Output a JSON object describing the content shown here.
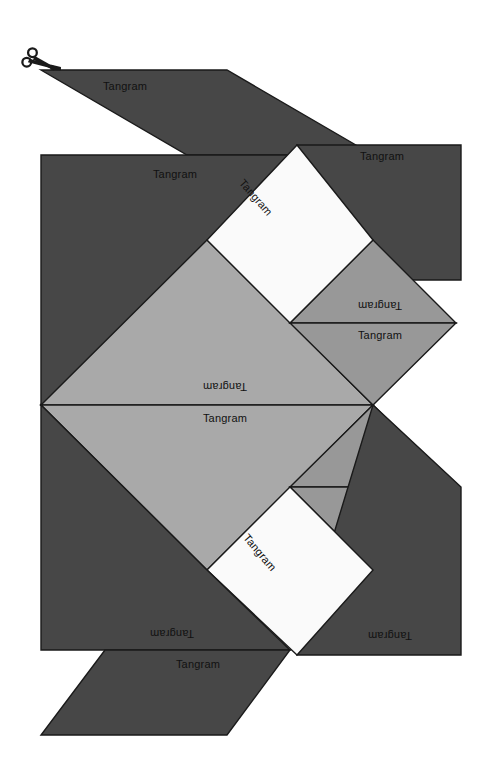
{
  "page": {
    "title": "Tangram",
    "background_color": "#ffffff",
    "width": 490,
    "height": 775
  },
  "colors": {
    "dark_gray": "#474747",
    "medium_gray": "#989898",
    "light_gray": "#a9a9a9",
    "white": "#fafafa",
    "outline": "#1a1a1a",
    "label_text": "#111111"
  },
  "cut_guide": {
    "icon": "scissors-icon",
    "label": ""
  },
  "labels": {
    "piece_label": "Tangram"
  },
  "pieces": [
    {
      "id": "top-parallelogram",
      "name": "Tangram",
      "shape": "parallelogram",
      "color": "#474747",
      "label_rotation": 0,
      "label_flipped": false
    },
    {
      "id": "upper-left-rect-dark",
      "name": "Tangram",
      "shape": "rectangle",
      "color": "#474747",
      "label_rotation": 0,
      "label_flipped": false
    },
    {
      "id": "upper-white-square",
      "name": "Tangram",
      "shape": "square",
      "color": "#fafafa",
      "label_rotation": -45,
      "label_flipped": false
    },
    {
      "id": "upper-right-rect-dark",
      "name": "Tangram",
      "shape": "rectangle",
      "color": "#474747",
      "label_rotation": 0,
      "label_flipped": false
    },
    {
      "id": "upper-right-tri-med-up",
      "name": "Tangram",
      "shape": "triangle",
      "color": "#989898",
      "label_rotation": 180,
      "label_flipped": true
    },
    {
      "id": "upper-right-tri-med-dn",
      "name": "Tangram",
      "shape": "triangle",
      "color": "#989898",
      "label_rotation": 0,
      "label_flipped": false
    },
    {
      "id": "center-large-tri-up",
      "name": "Tangram",
      "shape": "triangle",
      "color": "#a9a9a9",
      "label_rotation": 180,
      "label_flipped": true
    },
    {
      "id": "center-large-tri-dn",
      "name": "Tangram",
      "shape": "triangle",
      "color": "#a9a9a9",
      "label_rotation": 0,
      "label_flipped": false
    },
    {
      "id": "lower-right-tri-med-up",
      "name": "Tangram",
      "shape": "triangle",
      "color": "#989898",
      "label_rotation": 180,
      "label_flipped": true
    },
    {
      "id": "lower-right-tri-med-dn",
      "name": "Tangram",
      "shape": "triangle",
      "color": "#989898",
      "label_rotation": 0,
      "label_flipped": false
    },
    {
      "id": "lower-white-square",
      "name": "Tangram",
      "shape": "square",
      "color": "#fafafa",
      "label_rotation": -45,
      "label_flipped": false
    },
    {
      "id": "lower-right-rect-dark",
      "name": "Tangram",
      "shape": "rectangle",
      "color": "#474747",
      "label_rotation": 180,
      "label_flipped": true
    },
    {
      "id": "lower-left-rect-dark",
      "name": "Tangram",
      "shape": "rectangle",
      "color": "#474747",
      "label_rotation": 180,
      "label_flipped": true
    },
    {
      "id": "bottom-parallelogram",
      "name": "Tangram",
      "shape": "parallelogram",
      "color": "#474747",
      "label_rotation": 0,
      "label_flipped": false
    }
  ]
}
